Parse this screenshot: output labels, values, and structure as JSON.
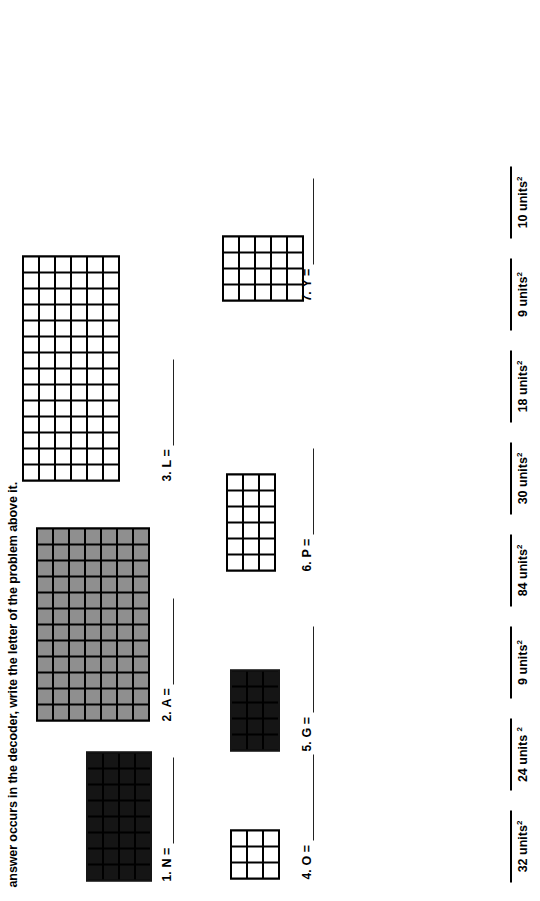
{
  "instructions": "answer occurs in the decoder, write the letter of the problem above it.",
  "problems": [
    {
      "number": "1.",
      "letter": "N =",
      "cols": 8,
      "rows": 4,
      "fill": "black"
    },
    {
      "number": "2.",
      "letter": "A =",
      "cols": 12,
      "rows": 7,
      "fill": "gray"
    },
    {
      "number": "3.",
      "letter": "L =",
      "cols": 14,
      "rows": 6,
      "fill": "white"
    },
    {
      "number": "4.",
      "letter": "O =",
      "cols": 3,
      "rows": 3,
      "fill": "white"
    },
    {
      "number": "5.",
      "letter": "G =",
      "cols": 5,
      "rows": 3,
      "fill": "black"
    },
    {
      "number": "6.",
      "letter": "P =",
      "cols": 6,
      "rows": 3,
      "fill": "white"
    },
    {
      "number": "7.",
      "letter": "Y =",
      "cols": 4,
      "rows": 5,
      "fill": "white"
    }
  ],
  "decoder": [
    {
      "value": "32 units",
      "exponent": "2"
    },
    {
      "value": "24 units ",
      "exponent": "2"
    },
    {
      "value": "9 units",
      "exponent": "2"
    },
    {
      "value": "84 units",
      "exponent": "2"
    },
    {
      "value": "30 units",
      "exponent": "2"
    },
    {
      "value": "18 units",
      "exponent": "2"
    },
    {
      "value": "9 units",
      "exponent": "2"
    },
    {
      "value": "10 units",
      "exponent": "2"
    }
  ]
}
